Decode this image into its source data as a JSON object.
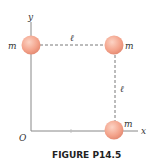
{
  "figure": {
    "caption": "FIGURE P14.5",
    "axes": {
      "x_label": "x",
      "y_label": "y",
      "origin_label": "O"
    },
    "masses": [
      {
        "label": "m",
        "position": "top-left"
      },
      {
        "label": "m",
        "position": "top-right"
      },
      {
        "label": "m",
        "position": "bottom-right"
      }
    ],
    "dimensions": [
      {
        "label": "ℓ",
        "side": "top"
      },
      {
        "label": "ℓ",
        "side": "right"
      }
    ],
    "colors": {
      "mass_fill": "#f4a48c",
      "mass_stroke": "#e08a72",
      "axis": "#888888",
      "dash": "#555555"
    }
  }
}
